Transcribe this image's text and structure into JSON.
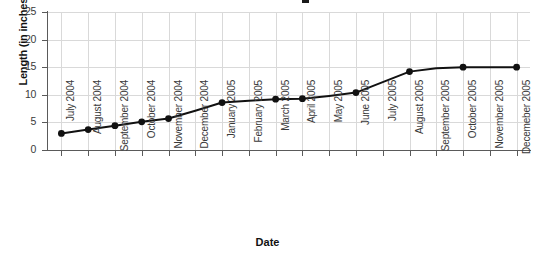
{
  "chart_data": {
    "type": "line",
    "title": "",
    "xlabel": "Date",
    "ylabel": "Length (in inches)",
    "ylim": [
      0,
      25
    ],
    "yticks": [
      0,
      5,
      10,
      15,
      20,
      25
    ],
    "grid": true,
    "legend": "none",
    "marker": "filled-circle",
    "line_color": "#111111",
    "marker_color": "#111111",
    "grid_color": "#d9d9d9",
    "axis_color": "#5a5a5a",
    "categories": [
      "July 2004",
      "August 2004",
      "September 2004",
      "October 2004",
      "November 2004",
      "December 2004",
      "January 2005",
      "February 2005",
      "March 2005",
      "April 2005",
      "May 2005",
      "June 2005",
      "July 2005",
      "August 2005",
      "September 2005",
      "October 2005",
      "November 2005",
      "Decemeber 2005"
    ],
    "values": [
      3.0,
      3.7,
      4.4,
      5.1,
      5.7,
      7.1,
      8.6,
      8.9,
      9.2,
      9.3,
      9.8,
      10.4,
      12.3,
      14.2,
      14.8,
      15.0,
      15.0,
      15.0
    ],
    "marker_visible": [
      true,
      true,
      true,
      true,
      true,
      false,
      true,
      false,
      true,
      true,
      false,
      true,
      false,
      true,
      false,
      true,
      false,
      true
    ],
    "series": [
      {
        "name": "Length",
        "values": [
          3.0,
          3.7,
          4.4,
          5.1,
          5.7,
          7.1,
          8.6,
          8.9,
          9.2,
          9.3,
          9.8,
          10.4,
          12.3,
          14.2,
          14.8,
          15.0,
          15.0,
          15.0
        ]
      }
    ]
  },
  "axes": {
    "y_title": "Length (in inches)",
    "x_title": "Date",
    "y_tick_labels": [
      "25",
      "20",
      "15",
      "10",
      "5",
      "0"
    ]
  }
}
